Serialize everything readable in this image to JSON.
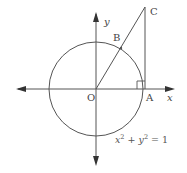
{
  "diagram": {
    "colors": {
      "stroke": "#555555",
      "text": "#444444",
      "background": "#ffffff"
    },
    "labels": {
      "x_axis": "x",
      "y_axis": "y",
      "origin": "O",
      "point_a": "A",
      "point_b": "B",
      "point_c": "C"
    },
    "equation": {
      "x_term": "x",
      "x_exp": "2",
      "plus": " + ",
      "y_term": "y",
      "y_exp": "2",
      "rhs": " = 1"
    },
    "elements": [
      "unit circle centered at O",
      "x-axis with arrows both ends",
      "y-axis with arrows both ends",
      "segment O to C through B on circle",
      "vertical tangent segment A to C",
      "right-angle marker at A"
    ]
  }
}
